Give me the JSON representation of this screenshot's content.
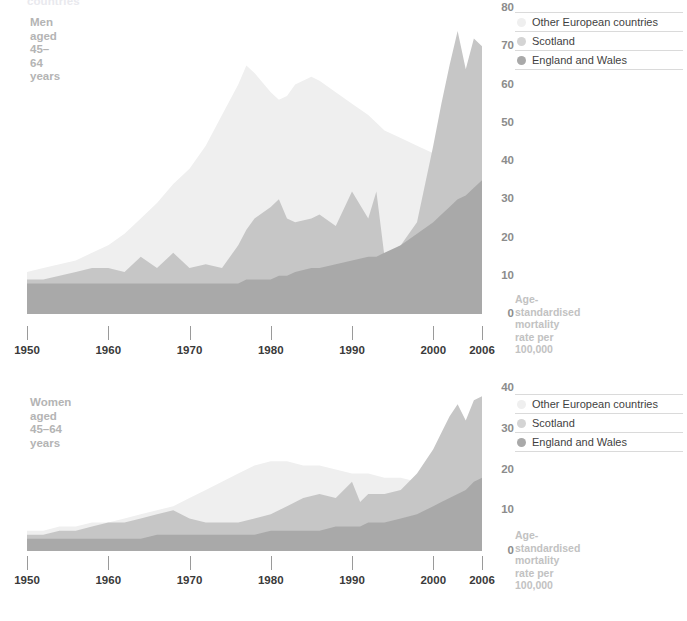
{
  "clipped_header": "countries",
  "colors": {
    "other_european": "#efefef",
    "scotland": "#c6c6c6",
    "england_wales": "#a9a9a9",
    "tick": "#3a3a3a",
    "panel_label": "#b4b4b4",
    "caption": "#c2c2c2"
  },
  "legend": {
    "items": [
      {
        "label": "Other European countries",
        "color": "#efefef"
      },
      {
        "label": "Scotland",
        "color": "#c6c6c6"
      },
      {
        "label": "England and Wales",
        "color": "#a9a9a9"
      }
    ]
  },
  "axis_caption": "Age-standardised\nmortality rate per 100,000",
  "panels": {
    "men": {
      "label": "Men aged\n45–64 years",
      "ylabel_ticks": [
        "80",
        "70",
        "60",
        "50",
        "40",
        "30",
        "20",
        "10",
        "0"
      ],
      "xlabels": [
        "1950",
        "1960",
        "1970",
        "1980",
        "1990",
        "2000",
        "2006"
      ]
    },
    "women": {
      "label": "Women aged\n45–64 years",
      "ylabel_ticks": [
        "40",
        "30",
        "20",
        "10",
        "0"
      ],
      "xlabels": [
        "1950",
        "1960",
        "1970",
        "1980",
        "1990",
        "2000",
        "2006"
      ]
    }
  },
  "chart_data": [
    {
      "type": "area",
      "id": "men",
      "title": "Men aged 45–64 years",
      "xlabel": "",
      "ylabel": "Age-standardised mortality rate per 100,000",
      "xlim": [
        1950,
        2006
      ],
      "ylim": [
        0,
        80
      ],
      "yticks": [
        0,
        10,
        20,
        30,
        40,
        50,
        60,
        70,
        80
      ],
      "xticks": [
        1950,
        1960,
        1970,
        1980,
        1990,
        2000,
        2006
      ],
      "grid": false,
      "legend_position": "right",
      "x": [
        1950,
        1952,
        1954,
        1956,
        1958,
        1960,
        1962,
        1964,
        1966,
        1968,
        1970,
        1972,
        1974,
        1976,
        1977,
        1978,
        1980,
        1981,
        1982,
        1983,
        1985,
        1986,
        1988,
        1990,
        1992,
        1993,
        1994,
        1996,
        1998,
        2000,
        2001,
        2002,
        2003,
        2004,
        2005,
        2006
      ],
      "series": [
        {
          "name": "Other European countries",
          "color": "#efefef",
          "values": [
            11,
            12,
            13,
            14,
            16,
            18,
            21,
            25,
            29,
            34,
            38,
            44,
            52,
            60,
            65,
            63,
            58,
            56,
            57,
            60,
            62,
            61,
            58,
            55,
            52,
            50,
            48,
            46,
            44,
            42,
            41,
            41,
            40,
            39,
            39,
            38
          ]
        },
        {
          "name": "Scotland",
          "color": "#c6c6c6",
          "values": [
            9,
            9,
            10,
            11,
            12,
            12,
            11,
            15,
            12,
            16,
            12,
            13,
            12,
            18,
            22,
            25,
            28,
            30,
            25,
            24,
            25,
            26,
            23,
            32,
            25,
            32,
            15,
            18,
            24,
            44,
            55,
            65,
            74,
            64,
            72,
            70
          ]
        },
        {
          "name": "England and Wales",
          "color": "#a9a9a9",
          "values": [
            8,
            8,
            8,
            8,
            8,
            8,
            8,
            8,
            8,
            8,
            8,
            8,
            8,
            8,
            9,
            9,
            9,
            10,
            10,
            11,
            12,
            12,
            13,
            14,
            15,
            15,
            16,
            18,
            21,
            24,
            26,
            28,
            30,
            31,
            33,
            35
          ]
        }
      ]
    },
    {
      "type": "area",
      "id": "women",
      "title": "Women aged 45–64 years",
      "xlabel": "",
      "ylabel": "Age-standardised mortality rate per 100,000",
      "xlim": [
        1950,
        2006
      ],
      "ylim": [
        0,
        40
      ],
      "yticks": [
        0,
        10,
        20,
        30,
        40
      ],
      "xticks": [
        1950,
        1960,
        1970,
        1980,
        1990,
        2000,
        2006
      ],
      "grid": false,
      "legend_position": "right",
      "x": [
        1950,
        1952,
        1954,
        1956,
        1958,
        1960,
        1962,
        1964,
        1966,
        1968,
        1970,
        1972,
        1974,
        1976,
        1978,
        1980,
        1982,
        1984,
        1986,
        1988,
        1990,
        1991,
        1992,
        1994,
        1996,
        1998,
        2000,
        2001,
        2002,
        2003,
        2004,
        2005,
        2006
      ],
      "series": [
        {
          "name": "Other European countries",
          "color": "#efefef",
          "values": [
            5,
            5,
            6,
            6,
            7,
            7,
            8,
            9,
            10,
            11,
            13,
            15,
            17,
            19,
            21,
            22,
            22,
            21,
            21,
            20,
            19,
            19,
            19,
            18,
            18,
            17,
            17,
            16,
            16,
            16,
            15,
            15,
            15
          ]
        },
        {
          "name": "Scotland",
          "color": "#c6c6c6",
          "values": [
            4,
            4,
            5,
            5,
            6,
            7,
            7,
            8,
            9,
            10,
            8,
            7,
            7,
            7,
            8,
            9,
            11,
            13,
            14,
            13,
            17,
            12,
            14,
            14,
            15,
            19,
            25,
            29,
            33,
            36,
            32,
            37,
            38
          ]
        },
        {
          "name": "England and Wales",
          "color": "#a9a9a9",
          "values": [
            3,
            3,
            3,
            3,
            3,
            3,
            3,
            3,
            4,
            4,
            4,
            4,
            4,
            4,
            4,
            5,
            5,
            5,
            5,
            6,
            6,
            6,
            7,
            7,
            8,
            9,
            11,
            12,
            13,
            14,
            15,
            17,
            18
          ]
        }
      ]
    }
  ]
}
